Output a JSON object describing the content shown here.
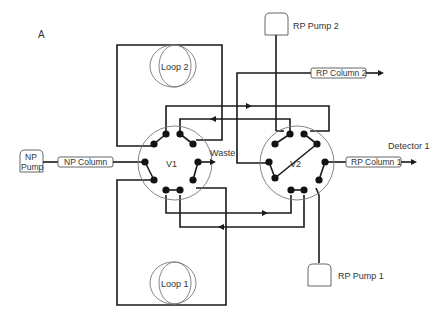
{
  "figure": {
    "panel_label": "A"
  },
  "valves": [
    {
      "id": "v1",
      "label": "V1"
    },
    {
      "id": "v2",
      "label": "V2"
    }
  ],
  "loops": [
    {
      "id": "loop2",
      "label": "Loop 2"
    },
    {
      "id": "loop1",
      "label": "Loop 1"
    }
  ],
  "pumps": {
    "np_pump": {
      "line1": "NP",
      "line2": "Pump"
    },
    "rp_pump_1": {
      "label": "RP Pump 1"
    },
    "rp_pump_2": {
      "label": "RP Pump 2"
    }
  },
  "columns": {
    "np_column": {
      "label": "NP Column"
    },
    "rp_column_1": {
      "label": "RP Column 1"
    },
    "rp_column_2": {
      "label": "RP Column 2"
    }
  },
  "outputs": {
    "waste": {
      "label": "Waste"
    },
    "detector_1": {
      "label": "Detector 1"
    }
  },
  "colors": {
    "line": "#1a1a1a",
    "valve_outline": "#777777",
    "text": "#333333",
    "background": "#ffffff"
  }
}
